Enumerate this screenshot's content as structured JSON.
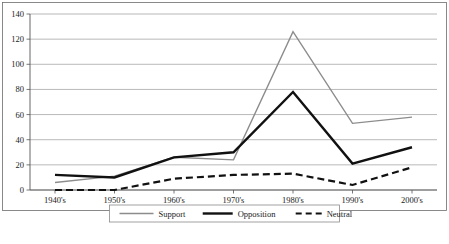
{
  "chart_data": {
    "type": "line",
    "title": "",
    "subtitle": "",
    "xlabel": "",
    "ylabel": "",
    "categories": [
      "1940's",
      "1950's",
      "1960's",
      "1970's",
      "1980's",
      "1990's",
      "2000's"
    ],
    "ylim": [
      0,
      140
    ],
    "yticks": [
      0,
      20,
      40,
      60,
      80,
      100,
      120,
      140
    ],
    "ytick_labels": [
      "0",
      "20",
      "40",
      "60",
      "80",
      "100",
      "120",
      "140"
    ],
    "grid": true,
    "grid_axis": "y",
    "legend_position": "bottom",
    "series": [
      {
        "name": "Support",
        "values": [
          6,
          11,
          26,
          24,
          126,
          53,
          58
        ],
        "color": "#8c8c8c",
        "style": "solid",
        "width": 1.4
      },
      {
        "name": "Opposition",
        "values": [
          12,
          10,
          26,
          30,
          78,
          21,
          34
        ],
        "color": "#111111",
        "style": "solid",
        "width": 2.4
      },
      {
        "name": "Neutral",
        "values": [
          0,
          0,
          9,
          12,
          13,
          4,
          18
        ],
        "color": "#111111",
        "style": "dashed",
        "width": 2.2
      }
    ]
  },
  "legend": {
    "items": [
      {
        "label": "Support"
      },
      {
        "label": "Opposition"
      },
      {
        "label": "Neutral"
      }
    ]
  }
}
